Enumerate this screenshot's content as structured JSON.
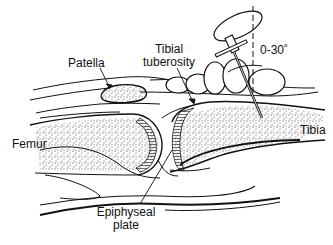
{
  "diagram": {
    "labels": {
      "patella": "Patella",
      "tibial_tuberosity_line1": "Tibial",
      "tibial_tuberosity_line2": "tuberosity",
      "angle": "0-30˚",
      "femur": "Femur",
      "tibia": "Tibia",
      "epiphyseal_line1": "Epiphyseal",
      "epiphyseal_line2": "plate"
    },
    "colors": {
      "ink": "#111111",
      "background": "#ffffff"
    }
  }
}
